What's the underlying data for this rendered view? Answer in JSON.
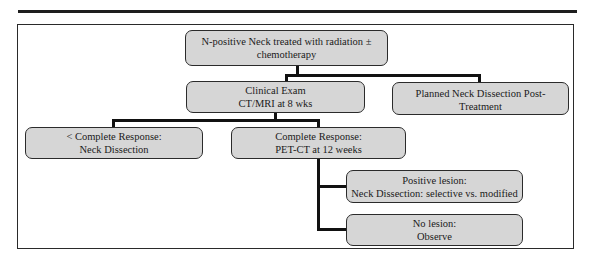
{
  "diagram": {
    "type": "flowchart",
    "nodes": {
      "root": {
        "lines": [
          "N-positive Neck treated with radiation ±",
          "chemotherapy"
        ]
      },
      "clinical_exam": {
        "lines": [
          "Clinical Exam",
          "CT/MRI at 8 wks"
        ]
      },
      "planned_dissection": {
        "lines": [
          "Planned Neck Dissection Post-Treatment"
        ]
      },
      "incomplete_response": {
        "lines": [
          "< Complete Response:",
          "Neck Dissection"
        ]
      },
      "complete_response": {
        "lines": [
          "Complete Response:",
          "PET-CT at 12 weeks"
        ]
      },
      "positive_lesion": {
        "lines": [
          "Positive lesion:",
          "Neck Dissection: selective vs. modified"
        ]
      },
      "no_lesion": {
        "lines": [
          "No lesion:",
          "Observe"
        ]
      }
    },
    "edges": [
      [
        "root",
        "clinical_exam"
      ],
      [
        "root",
        "planned_dissection"
      ],
      [
        "clinical_exam",
        "incomplete_response"
      ],
      [
        "clinical_exam",
        "complete_response"
      ],
      [
        "complete_response",
        "positive_lesion"
      ],
      [
        "complete_response",
        "no_lesion"
      ]
    ],
    "colors": {
      "node_fill": "#d6d6d6",
      "node_border": "#2b2b2b",
      "connector": "#111111"
    }
  }
}
